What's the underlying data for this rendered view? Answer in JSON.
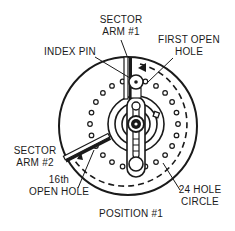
{
  "diagram": {
    "title": "POSITION #1",
    "colors": {
      "ink": "#1a1a1a",
      "background": "#ffffff"
    },
    "labels": {
      "sector_arm_1": {
        "line1": "SECTOR",
        "line2": "ARM #1"
      },
      "index_pin": {
        "line1": "INDEX PIN"
      },
      "first_open_hole": {
        "line1": "FIRST OPEN",
        "line2": "HOLE"
      },
      "sector_arm_2": {
        "line1": "SECTOR",
        "line2": "ARM #2"
      },
      "sixteenth_open_hole": {
        "line1": "16th",
        "line2": "OPEN HOLE"
      },
      "hole_circle": {
        "line1": "24 HOLE",
        "line2": "CIRCLE"
      },
      "position": {
        "line1": "POSITION #1"
      }
    },
    "hole_count": 24
  }
}
